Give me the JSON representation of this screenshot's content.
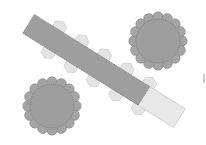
{
  "diagram": {
    "type": "seating-layout",
    "colors": {
      "background": "#ffffff",
      "table_fill": "#9e9e9e",
      "table_stroke": "#7a7a7a",
      "chair_fill": "#e4e4e4",
      "chair_stroke": "#cfcfcf",
      "table_extension_fill": "#e8e8e8",
      "table_extension_stroke": "#c8c8c8",
      "scallop_fill": "#a4a4a4"
    },
    "long_table": {
      "angle_deg": 32,
      "cx": 104,
      "cy": 71,
      "length": 178,
      "thickness": 22,
      "extension_length": 42,
      "chairs_top": 5,
      "chairs_bottom": 5
    },
    "round_tables": [
      {
        "name": "round-table-top-right",
        "cx": 158,
        "cy": 41,
        "r": 22,
        "scallops": 16
      },
      {
        "name": "round-table-bottom-left",
        "cx": 52,
        "cy": 106,
        "r": 22,
        "scallops": 16
      }
    ],
    "marker": {
      "x": 204,
      "y": 74,
      "h": 9
    }
  }
}
